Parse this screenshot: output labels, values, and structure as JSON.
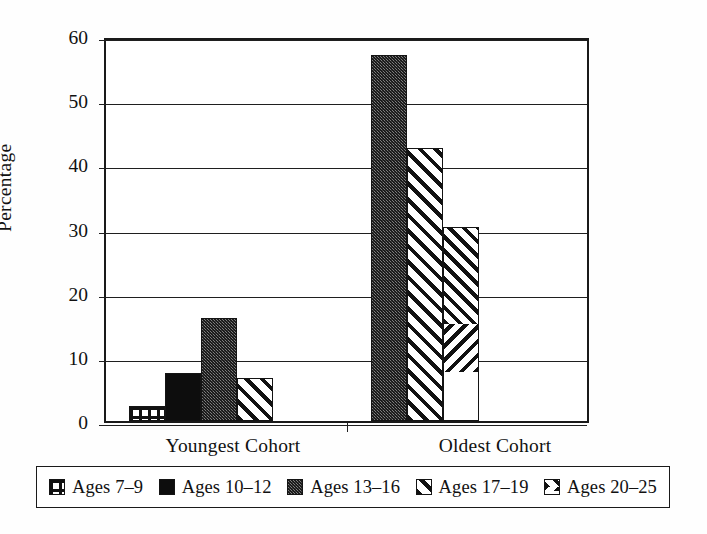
{
  "chart_data": {
    "type": "bar",
    "title": "",
    "xlabel": "",
    "ylabel": "Percentage",
    "ylim": [
      0,
      60
    ],
    "yticks": [
      0,
      10,
      20,
      30,
      40,
      50,
      60
    ],
    "grid": true,
    "legend_position": "bottom",
    "categories": [
      "Youngest Cohort",
      "Oldest Cohort"
    ],
    "series": [
      {
        "name": "Ages 7–9",
        "pattern": "lattice",
        "values": [
          2.3,
          0
        ]
      },
      {
        "name": "Ages 10–12",
        "pattern": "solid",
        "values": [
          7.5,
          0
        ]
      },
      {
        "name": "Ages 13–16",
        "pattern": "stipple",
        "values": [
          16.1,
          57.1
        ]
      },
      {
        "name": "Ages 17–19",
        "pattern": "diagonal",
        "values": [
          6.7,
          42.6
        ]
      },
      {
        "name": "Ages 20–25",
        "pattern": "chevron",
        "values": [
          0,
          30.3
        ]
      }
    ]
  },
  "axis": {
    "y_title": "Percentage",
    "y_tick_labels": [
      "0",
      "10",
      "20",
      "30",
      "40",
      "50",
      "60"
    ],
    "x_tick_labels": [
      "Youngest Cohort",
      "Oldest Cohort"
    ]
  },
  "legend": {
    "entries": [
      {
        "label": "Ages 7–9",
        "pattern": "lattice"
      },
      {
        "label": "Ages 10–12",
        "pattern": "solid"
      },
      {
        "label": "Ages 13–16",
        "pattern": "stipple"
      },
      {
        "label": "Ages 17–19",
        "pattern": "diagonal"
      },
      {
        "label": "Ages 20–25",
        "pattern": "chevron"
      }
    ]
  },
  "colors": {
    "axis": "#1a1a1a",
    "grid": "#1f1f1f",
    "background": "#ffffff",
    "ink": "#111111",
    "stipple_fill": "#4a4a4a"
  }
}
